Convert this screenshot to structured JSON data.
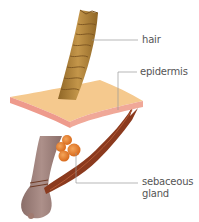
{
  "diagram": {
    "labels": {
      "hair": "hair",
      "epidermis": "epidermis",
      "sebaceous_line1": "sebaceous",
      "sebaceous_line2": "gland"
    },
    "colors": {
      "hair_shaft": "#b88a3a",
      "hair_shaft_dark": "#8a6224",
      "epidermis_top": "#f5c98e",
      "epidermis_edge": "#ee9a8c",
      "follicle": "#9c7e78",
      "follicle_dark": "#7d625d",
      "sebaceous_gland": "#e8802a",
      "muscle": "#8b3a1e",
      "leader_line": "#999999",
      "label_text": "#555555"
    }
  }
}
